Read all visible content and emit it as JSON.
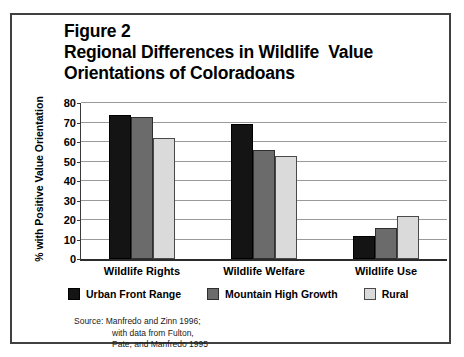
{
  "figure": {
    "title_lines": [
      "Figure 2",
      "Regional Differences in Wildlife  Value",
      "Orientations of Coloradoans"
    ],
    "source_lines": [
      "Source: Manfredo and Zinn 1996;",
      "with data from Fulton,",
      "Pate, and Manfredo 1995"
    ]
  },
  "chart_data": {
    "type": "bar",
    "title": "Figure 2 Regional Differences in Wildlife  Value Orientations of Coloradoans",
    "xlabel": "",
    "ylabel": "% with Positive Value Orientation",
    "ylim": [
      0,
      80
    ],
    "ytick_step": 10,
    "yticks": [
      0,
      10,
      20,
      30,
      40,
      50,
      60,
      70,
      80
    ],
    "ytick_labels": [
      "0",
      "10",
      "20",
      "30",
      "40",
      "50",
      "60",
      "70",
      "80"
    ],
    "grid": true,
    "legend_position": "bottom",
    "categories": [
      "Wildlife Rights",
      "Wildlife Welfare",
      "Wildlife Use"
    ],
    "series": [
      {
        "name": "Urban Front Range",
        "color": "#141414",
        "values": [
          74,
          69,
          12
        ]
      },
      {
        "name": "Mountain High Growth",
        "color": "#6b6b6b",
        "values": [
          73,
          56,
          16
        ]
      },
      {
        "name": "Rural",
        "color": "#dadada",
        "values": [
          62,
          53,
          22
        ]
      }
    ]
  }
}
